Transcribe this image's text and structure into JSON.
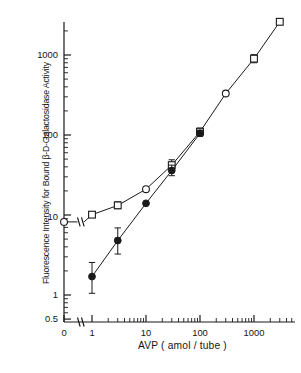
{
  "figure": {
    "axis_title_y_part1": "Fluorescence Intensity for Bound ",
    "axis_title_y_beta": "β",
    "axis_title_y_part2": "-D-Galactosidase Activity",
    "axis_title_y_full": "Fluorescence Intensity for Bound β-D-Galactosidase Activity",
    "axis_title_x": "AVP ( amol / tube )",
    "caption": "Fig. 2.  Fluorescence response of AVP in the two assay conditions"
  },
  "ticks": {
    "y_labels": [
      "1000",
      "100",
      "10",
      "1",
      "0.5"
    ],
    "x_labels": [
      "0",
      "1",
      "10",
      "100",
      "1000"
    ]
  },
  "chart_data": {
    "type": "line",
    "title": "",
    "xlabel": "AVP ( amol / tube )",
    "ylabel": "Fluorescence Intensity for Bound β-D-Galactosidase Activity",
    "xscale": "log",
    "yscale": "log",
    "xlim": [
      1,
      4000
    ],
    "ylim": [
      0.5,
      4000
    ],
    "x_ticks": [
      1,
      10,
      100,
      1000
    ],
    "y_ticks": [
      0.5,
      1,
      10,
      100,
      1000
    ],
    "axis_break_x": true,
    "zero_point_shown": true,
    "grid": false,
    "legend": "none",
    "series": [
      {
        "name": "open-symbols",
        "marker": "open-square / open-circle",
        "filled": false,
        "points": [
          {
            "x": 0,
            "y": 8.2,
            "marker": "open-circle",
            "err_low": null,
            "err_high": null
          },
          {
            "x": 1,
            "y": 10.1,
            "marker": "open-square",
            "err_low": 9.4,
            "err_high": 10.9
          },
          {
            "x": 3,
            "y": 13.2,
            "marker": "open-square",
            "err_low": 12.0,
            "err_high": 14.6
          },
          {
            "x": 10,
            "y": 21.0,
            "marker": "open-circle",
            "err_low": null,
            "err_high": null
          },
          {
            "x": 30,
            "y": 42.0,
            "marker": "open-square",
            "err_low": 36.0,
            "err_high": 49.0
          },
          {
            "x": 100,
            "y": 110.0,
            "marker": "open-square",
            "err_low": 100.0,
            "err_high": 122.0
          },
          {
            "x": 300,
            "y": 330.0,
            "marker": "open-circle",
            "err_low": null,
            "err_high": null
          },
          {
            "x": 1000,
            "y": 900.0,
            "marker": "open-square",
            "err_low": 800.0,
            "err_high": 1010.0
          },
          {
            "x": 3000,
            "y": 2600.0,
            "marker": "open-square",
            "err_low": null,
            "err_high": null
          }
        ]
      },
      {
        "name": "filled-circles",
        "marker": "filled-circle",
        "filled": true,
        "points": [
          {
            "x": 1,
            "y": 1.7,
            "err_low": 1.05,
            "err_high": 2.55
          },
          {
            "x": 3,
            "y": 4.8,
            "err_low": 3.25,
            "err_high": 6.9
          },
          {
            "x": 10,
            "y": 14.0,
            "err_low": null,
            "err_high": null
          },
          {
            "x": 30,
            "y": 36.0,
            "err_low": 31.0,
            "err_high": 42.0
          },
          {
            "x": 100,
            "y": 105.0,
            "err_low": 96.0,
            "err_high": 115.0
          }
        ]
      }
    ]
  }
}
